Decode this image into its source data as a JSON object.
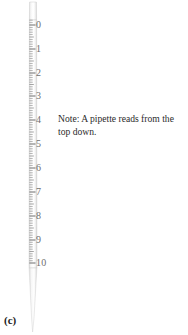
{
  "figure": {
    "panel_label": "(c)",
    "background_color": "#ffffff"
  },
  "note": {
    "text": "Note: A pipette reads from the top down.",
    "line1": "Note: A pipette reads from the",
    "line2": "top down.",
    "color": "#2b2b2b"
  },
  "pipette": {
    "name": "graduated-pipette",
    "body_color": "#f2f2f2",
    "edge_color": "#c9c9c9",
    "tick_color": "#777777",
    "label_color": "#6f6f6f",
    "top_y": 2,
    "tip_y": 332,
    "scale_top_y": 25,
    "scale_bottom_y": 264,
    "minor_ticks_per_major": 10
  },
  "chart_data": {
    "type": "scale",
    "title": "",
    "orientation": "vertical",
    "reads": "top-down",
    "unit": "mL",
    "major_ticks": [
      {
        "label": "0",
        "value": 0,
        "y": 25
      },
      {
        "label": "1",
        "value": 1,
        "y": 49
      },
      {
        "label": "2",
        "value": 2,
        "y": 73
      },
      {
        "label": "3",
        "value": 3,
        "y": 96
      },
      {
        "label": "4",
        "value": 4,
        "y": 120
      },
      {
        "label": "5",
        "value": 5,
        "y": 144
      },
      {
        "label": "6",
        "value": 6,
        "y": 168
      },
      {
        "label": "7",
        "value": 7,
        "y": 192
      },
      {
        "label": "8",
        "value": 8,
        "y": 216
      },
      {
        "label": "9",
        "value": 9,
        "y": 240
      },
      {
        "label": "10",
        "value": 10,
        "y": 263
      }
    ],
    "range": [
      0,
      10
    ]
  }
}
